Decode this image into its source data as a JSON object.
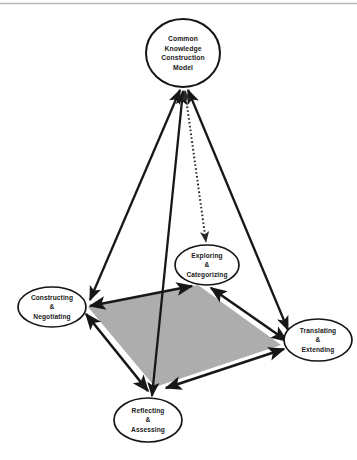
{
  "diagram": {
    "type": "pyramid-cycle-diagram",
    "colors": {
      "base_fill": "#adadad",
      "stroke": "#171717",
      "node_fill": "#ffffff",
      "text": "#1a1a1a",
      "top_rule": "#b9b9b9"
    },
    "nodes": [
      {
        "id": "apex",
        "name": "common-knowledge-construction-model",
        "lines": [
          "Common",
          "Knowledge",
          "Construction",
          "Model"
        ],
        "cx": 183,
        "cy": 53,
        "rx": 37,
        "ry": 34
      },
      {
        "id": "exploring",
        "name": "exploring-and-categorizing",
        "lines": [
          "Exploring",
          "&",
          "Categorizing"
        ],
        "cx": 207,
        "cy": 265,
        "rx": 32,
        "ry": 20
      },
      {
        "id": "constructing",
        "name": "constructing-and-negotiating",
        "lines": [
          "Constructing",
          "&",
          "Negotiating"
        ],
        "cx": 52,
        "cy": 307,
        "rx": 34,
        "ry": 20
      },
      {
        "id": "translating",
        "name": "translating-and-extending",
        "lines": [
          "Translating",
          "&",
          "Extending"
        ],
        "cx": 318,
        "cy": 340,
        "rx": 34,
        "ry": 21
      },
      {
        "id": "reflecting",
        "name": "reflecting-and-assessing",
        "lines": [
          "Reflecting",
          "&",
          "Assessing"
        ],
        "cx": 148,
        "cy": 420,
        "rx": 34,
        "ry": 22
      }
    ],
    "base_polygon": {
      "name": "shaded-base-quadrilateral",
      "points": "88,307 198,285 281,345 155,387"
    },
    "edges": [
      {
        "id": "apex-to-constructing",
        "from": "apex",
        "to": "constructing",
        "style": "solid",
        "arrows": "both"
      },
      {
        "id": "apex-to-reflecting",
        "from": "apex",
        "to": "reflecting",
        "style": "solid",
        "arrows": "both"
      },
      {
        "id": "apex-to-translating",
        "from": "apex",
        "to": "translating",
        "style": "solid",
        "arrows": "both"
      },
      {
        "id": "apex-to-exploring",
        "from": "apex",
        "to": "exploring",
        "style": "dotted",
        "arrows": "both"
      },
      {
        "id": "constructing-to-exploring",
        "from": "constructing",
        "to": "exploring",
        "style": "solid",
        "arrows": "both"
      },
      {
        "id": "exploring-to-translating",
        "from": "exploring",
        "to": "translating",
        "style": "solid",
        "arrows": "both"
      },
      {
        "id": "translating-to-reflecting",
        "from": "translating",
        "to": "reflecting",
        "style": "solid",
        "arrows": "both"
      },
      {
        "id": "reflecting-to-constructing",
        "from": "reflecting",
        "to": "constructing",
        "style": "solid",
        "arrows": "both"
      }
    ]
  }
}
